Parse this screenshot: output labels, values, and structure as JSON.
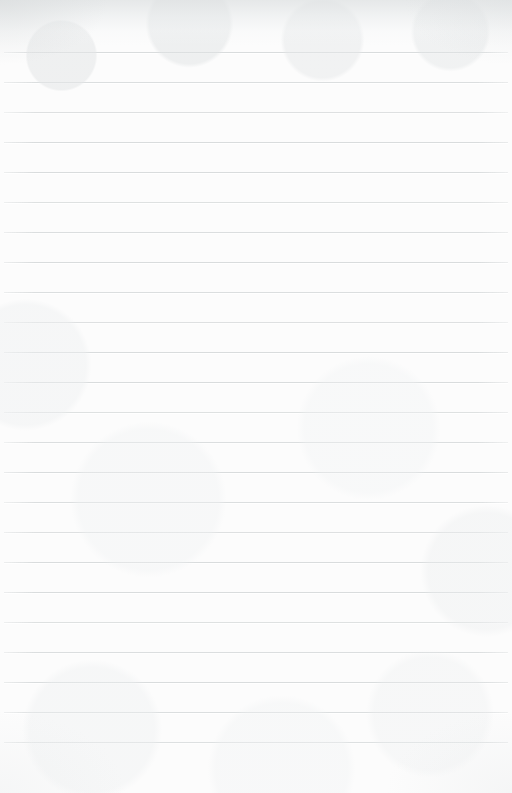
{
  "document": {
    "kind": "ruled-notebook-paper",
    "title": "Blank lined paper",
    "body_text": "",
    "page_width": 512,
    "page_height": 793,
    "paper_color": "#fcfcfc",
    "is_blank": true
  },
  "ruling": {
    "line_color": "#d9dcdd",
    "line_thickness": 1,
    "line_spacing": 30,
    "first_line_y": 52,
    "line_start_x": 4,
    "line_end_x": 508,
    "line_count": 24,
    "line_y_positions": [
      52,
      82,
      112,
      142,
      172,
      202,
      232,
      262,
      292,
      322,
      352,
      382,
      412,
      442,
      472,
      502,
      532,
      562,
      592,
      622,
      652,
      682,
      712,
      742
    ],
    "margin_top": 52,
    "margin_bottom": 39,
    "has_vertical_margin_rule": false
  },
  "texture": {
    "top_edge_shade_color": "#dee1e2",
    "top_edge_shade_height": 46,
    "vignette_color": "#d8dbdc",
    "grain_color": "#eef0f1"
  }
}
